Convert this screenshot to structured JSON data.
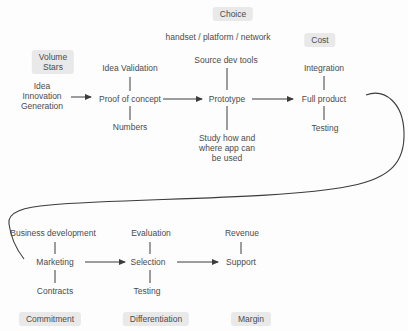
{
  "colors": {
    "background": "#fdfdfd",
    "label_bg": "#e9e9e9",
    "text": "#4b4b4b",
    "line": "#3c3c3c"
  },
  "stage_labels": {
    "choice": "Choice",
    "volume_stars": "Volume\nStars",
    "cost": "Cost",
    "commitment": "Commitment",
    "differentiation": "Differentiation",
    "margin": "Margin"
  },
  "top_row": {
    "idea_generation": "Idea\nInnovation\nGeneration",
    "idea_validation": "Idea Validation",
    "proof_of_concept": "Proof of concept",
    "numbers": "Numbers",
    "handset_platform_network": "handset / platform / network",
    "source_dev_tools": "Source dev tools",
    "prototype": "Prototype",
    "study_usage": "Study how and\nwhere app can\nbe used",
    "integration": "Integration",
    "full_product": "Full product",
    "testing": "Testing"
  },
  "bottom_row": {
    "business_development": "Business development",
    "marketing": "Marketing",
    "contracts": "Contracts",
    "evaluation": "Evaluation",
    "selection": "Selection",
    "testing": "Testing",
    "revenue": "Revenue",
    "support": "Support"
  }
}
